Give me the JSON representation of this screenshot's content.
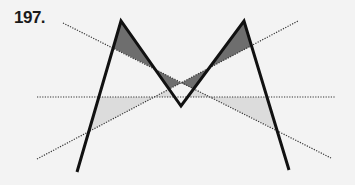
{
  "figure": {
    "number_label": "197.",
    "colors": {
      "background": "#f3f3f3",
      "stroke": "#111111",
      "dotted": "#333333",
      "dark_fill": "#6e6e6e",
      "light_fill": "#dcdcdc"
    }
  }
}
